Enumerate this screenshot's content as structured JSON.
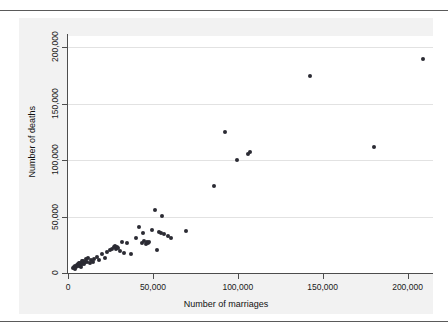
{
  "figure": {
    "background_color": "#ffffff",
    "panel_color": "#f2f2f2",
    "plot_color": "#ffffff",
    "marker_color": "#2b2b33",
    "grid_color": "#e2e2e2",
    "axis_color": "#4d4d4d",
    "rule_top": true,
    "rule_bottom": true
  },
  "chart_data": {
    "type": "scatter",
    "title": "",
    "xlabel": "Number of marriages",
    "ylabel": "Number of deaths",
    "xlim": [
      0,
      215000
    ],
    "ylim": [
      0,
      210000
    ],
    "grid": true,
    "legend": null,
    "xticks": [
      0,
      50000,
      100000,
      150000,
      200000
    ],
    "xticklabels": [
      "0",
      "50,000",
      "100,000",
      "150,000",
      "200,000"
    ],
    "yticks": [
      0,
      50000,
      100000,
      150000,
      200000
    ],
    "yticklabels": [
      "0",
      "50,000",
      "100,000",
      "150,000",
      "200,000"
    ],
    "series": [
      {
        "name": "states",
        "points": [
          [
            3200,
            4200
          ],
          [
            3600,
            5000
          ],
          [
            4100,
            3800
          ],
          [
            4400,
            6200
          ],
          [
            4800,
            5200
          ],
          [
            5200,
            7000
          ],
          [
            5600,
            6000
          ],
          [
            5900,
            8200
          ],
          [
            6300,
            7200
          ],
          [
            6600,
            9000
          ],
          [
            6900,
            6400
          ],
          [
            7200,
            8600
          ],
          [
            7600,
            5600
          ],
          [
            8000,
            10200
          ],
          [
            8400,
            8000
          ],
          [
            8800,
            11000
          ],
          [
            9300,
            7600
          ],
          [
            9800,
            9400
          ],
          [
            10400,
            12400
          ],
          [
            11200,
            10000
          ],
          [
            12000,
            13200
          ],
          [
            12800,
            8800
          ],
          [
            13600,
            11600
          ],
          [
            14600,
            9800
          ],
          [
            15600,
            12800
          ],
          [
            16800,
            14600
          ],
          [
            18200,
            11200
          ],
          [
            20000,
            16800
          ],
          [
            21600,
            13600
          ],
          [
            23000,
            18400
          ],
          [
            24800,
            20600
          ],
          [
            26200,
            21400
          ],
          [
            27000,
            22800
          ],
          [
            27600,
            24200
          ],
          [
            28000,
            21000
          ],
          [
            28600,
            23400
          ],
          [
            29400,
            22000
          ],
          [
            30600,
            19600
          ],
          [
            31600,
            27200
          ],
          [
            33200,
            17400
          ],
          [
            34800,
            26800
          ],
          [
            37400,
            16600
          ],
          [
            40000,
            31000
          ],
          [
            42000,
            41200
          ],
          [
            43400,
            26600
          ],
          [
            44200,
            35400
          ],
          [
            45000,
            28200
          ],
          [
            45800,
            25600
          ],
          [
            46400,
            27400
          ],
          [
            47000,
            26200
          ],
          [
            48000,
            27800
          ],
          [
            49200,
            38200
          ],
          [
            51400,
            55400
          ],
          [
            52600,
            20000
          ],
          [
            53400,
            36600
          ],
          [
            54800,
            35400
          ],
          [
            55200,
            50800
          ],
          [
            56800,
            35000
          ],
          [
            58800,
            33200
          ],
          [
            60400,
            30800
          ],
          [
            69600,
            36800
          ],
          [
            86000,
            77000
          ],
          [
            92400,
            124800
          ],
          [
            99400,
            100400
          ],
          [
            106000,
            105600
          ],
          [
            107200,
            107400
          ],
          [
            142400,
            174600
          ],
          [
            180000,
            111400
          ],
          [
            209400,
            189600
          ]
        ]
      }
    ]
  },
  "axis_titles": {
    "x": "Number of marriages",
    "y": "Number of deaths"
  }
}
